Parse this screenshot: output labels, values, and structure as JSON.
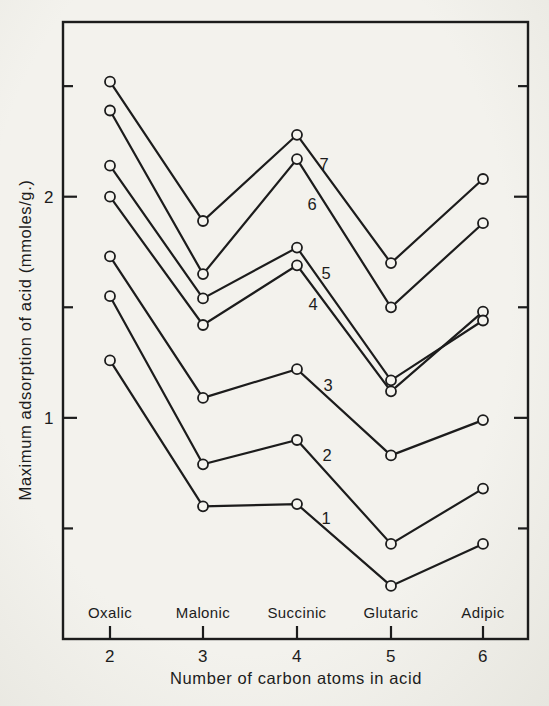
{
  "figure": {
    "paper_color": "#f3f2ed",
    "ink_color": "#1c1c1c",
    "marker_fill": "#f5f4ef"
  },
  "chart_data": {
    "type": "line",
    "title": "",
    "xlabel": "Number of carbon atoms in acid",
    "ylabel": "Maximum adsorption of acid (mmoles/g.)",
    "categories": [
      "Oxalic",
      "Malonic",
      "Succinic",
      "Glutaric",
      "Adipic"
    ],
    "x_values": [
      2,
      3,
      4,
      5,
      6
    ],
    "x_tick_labels": [
      "2",
      "3",
      "4",
      "5",
      "6"
    ],
    "ylim": [
      0,
      2.79
    ],
    "y_ticks": [
      0.5,
      1.0,
      1.5,
      2.0,
      2.5
    ],
    "y_labeled_ticks": [
      1,
      2
    ],
    "grid": false,
    "legend_position": "numbers printed beside each curve",
    "marker": "open-circle",
    "series": [
      {
        "name": "1",
        "values": [
          1.26,
          0.6,
          0.61,
          0.24,
          0.43
        ],
        "label_xy": [
          326,
          524
        ]
      },
      {
        "name": "2",
        "values": [
          1.55,
          0.79,
          0.9,
          0.43,
          0.68
        ],
        "label_xy": [
          327,
          461
        ]
      },
      {
        "name": "3",
        "values": [
          1.73,
          1.09,
          1.22,
          0.83,
          0.99
        ],
        "label_xy": [
          328,
          391
        ]
      },
      {
        "name": "4",
        "values": [
          2.0,
          1.42,
          1.69,
          1.12,
          1.48
        ],
        "label_xy": [
          313,
          310
        ]
      },
      {
        "name": "5",
        "values": [
          2.14,
          1.54,
          1.77,
          1.17,
          1.44
        ],
        "label_xy": [
          326,
          279
        ]
      },
      {
        "name": "6",
        "values": [
          2.39,
          1.65,
          2.17,
          1.5,
          1.88
        ],
        "label_xy": [
          312,
          210
        ]
      },
      {
        "name": "7",
        "values": [
          2.52,
          1.89,
          2.28,
          1.7,
          2.08
        ],
        "label_xy": [
          324,
          170
        ]
      }
    ]
  }
}
